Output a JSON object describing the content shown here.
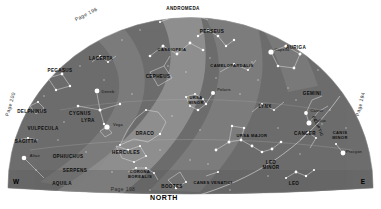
{
  "chart_data": {
    "type": "scatter",
    "subtitle": "Constellations visible looking north",
    "xlabel": "",
    "ylabel": "",
    "grid": false,
    "legend_position": "none",
    "projection": "half-dome / horizon",
    "dome": {
      "fill": "#6f6f6f",
      "milky_way_fill": "#8d8d8d",
      "background": "#ffffff",
      "line_color": "#d8d8d8",
      "star_color": "#ffffff"
    },
    "compass": [
      {
        "label": "W",
        "x": 16,
        "y": 181
      },
      {
        "label": "E",
        "x": 363,
        "y": 181
      },
      {
        "label": "NORTH",
        "x": 164,
        "y": 197
      }
    ],
    "page_refs": [
      {
        "label": "Page 196",
        "x": 86,
        "y": 14,
        "rotate": -27
      },
      {
        "label": "Page 200",
        "x": 10,
        "y": 104,
        "rotate": -74
      },
      {
        "label": "Page 198",
        "x": 123,
        "y": 189,
        "rotate": 0
      },
      {
        "label": "Page 194",
        "x": 360,
        "y": 104,
        "rotate": -76
      }
    ],
    "ecliptic_label": {
      "label": "ECLIPTIC",
      "x": 318,
      "y": 126,
      "rotate": 66
    },
    "constellations": [
      {
        "name": "ANDROMEDA",
        "x": 183,
        "y": 8
      },
      {
        "name": "PERSEUS",
        "x": 212,
        "y": 31
      },
      {
        "name": "CASSIOPEIA",
        "x": 172,
        "y": 49
      },
      {
        "name": "CEPHEUS",
        "x": 158,
        "y": 76
      },
      {
        "name": "LACERTA",
        "x": 101,
        "y": 58
      },
      {
        "name": "PEGASUS",
        "x": 60,
        "y": 70
      },
      {
        "name": "CAMELOPARDALIS",
        "x": 232,
        "y": 65
      },
      {
        "name": "AURIGA",
        "x": 296,
        "y": 47
      },
      {
        "name": "GEMINI",
        "x": 312,
        "y": 93
      },
      {
        "name": "URSA MINOR",
        "x": 196,
        "y": 101
      },
      {
        "name": "DRACO",
        "x": 145,
        "y": 133
      },
      {
        "name": "LYRA",
        "x": 88,
        "y": 120
      },
      {
        "name": "CYGNUS",
        "x": 80,
        "y": 113
      },
      {
        "name": "DELPHINUS",
        "x": 32,
        "y": 111
      },
      {
        "name": "VULPECULA",
        "x": 43,
        "y": 128
      },
      {
        "name": "SAGITTA",
        "x": 26,
        "y": 141
      },
      {
        "name": "HERCULES",
        "x": 126,
        "y": 152
      },
      {
        "name": "CORONA BOREALIS",
        "x": 140,
        "y": 175
      },
      {
        "name": "BOOTES",
        "x": 172,
        "y": 186
      },
      {
        "name": "CANES VENATICI",
        "x": 213,
        "y": 182
      },
      {
        "name": "URSA MAJOR",
        "x": 252,
        "y": 135
      },
      {
        "name": "LYNX",
        "x": 265,
        "y": 106
      },
      {
        "name": "CANCER",
        "x": 305,
        "y": 133
      },
      {
        "name": "LEO MINOR",
        "x": 271,
        "y": 166
      },
      {
        "name": "LEO",
        "x": 294,
        "y": 183
      },
      {
        "name": "CANIS MINOR",
        "x": 340,
        "y": 136
      },
      {
        "name": "OPHIUCHUS",
        "x": 68,
        "y": 156
      },
      {
        "name": "SERPENS",
        "x": 75,
        "y": 170
      },
      {
        "name": "AQUILA",
        "x": 62,
        "y": 183
      }
    ],
    "stars": [
      {
        "name": "Deneb",
        "x": 97,
        "y": 91
      },
      {
        "name": "Vega",
        "x": 107,
        "y": 124
      },
      {
        "name": "Altair",
        "x": 24,
        "y": 155
      },
      {
        "name": "Polaris",
        "x": 213,
        "y": 89
      },
      {
        "name": "Capella",
        "x": 271,
        "y": 49
      },
      {
        "name": "Castor",
        "x": 306,
        "y": 110
      },
      {
        "name": "Pollux",
        "x": 309,
        "y": 120
      },
      {
        "name": "Procyon",
        "x": 343,
        "y": 151
      }
    ]
  }
}
